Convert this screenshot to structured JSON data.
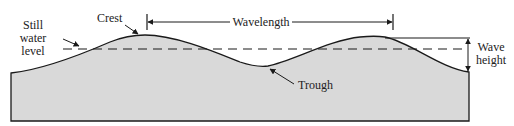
{
  "diagram": {
    "labels": {
      "crest": "Crest",
      "still_water_1": "Still",
      "still_water_2": "water",
      "still_water_3": "level",
      "wavelength": "Wavelength",
      "trough": "Trough",
      "wave_height_1": "Wave",
      "wave_height_2": "height"
    },
    "colors": {
      "water_fill": "#d9d9d9",
      "stroke": "#1a1a1a",
      "background": "#ffffff"
    }
  }
}
